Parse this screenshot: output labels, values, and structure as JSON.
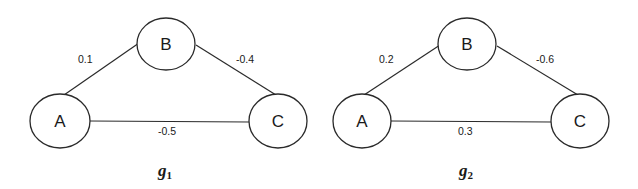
{
  "graphs": [
    {
      "caption": "g",
      "caption_sub": "1",
      "nodes": {
        "A": {
          "label": "A",
          "cx": 60,
          "cy": 121,
          "rx": 30,
          "ry": 27
        },
        "B": {
          "label": "B",
          "cx": 166,
          "cy": 44,
          "rx": 29,
          "ry": 26
        },
        "C": {
          "label": "C",
          "cx": 278,
          "cy": 121,
          "rx": 29,
          "ry": 27
        }
      },
      "edges": {
        "AB": {
          "from": "A",
          "to": "B",
          "weight": "0.1"
        },
        "BC": {
          "from": "B",
          "to": "C",
          "weight": "-0.4"
        },
        "AC": {
          "from": "A",
          "to": "C",
          "weight": "-0.5"
        }
      }
    },
    {
      "caption": "g",
      "caption_sub": "2",
      "nodes": {
        "A": {
          "label": "A",
          "cx": 362,
          "cy": 121,
          "rx": 29,
          "ry": 27
        },
        "B": {
          "label": "B",
          "cx": 467,
          "cy": 44,
          "rx": 29,
          "ry": 26
        },
        "C": {
          "label": "C",
          "cx": 580,
          "cy": 121,
          "rx": 29,
          "ry": 27
        }
      },
      "edges": {
        "AB": {
          "from": "A",
          "to": "B",
          "weight": "0.2"
        },
        "BC": {
          "from": "B",
          "to": "C",
          "weight": "-0.6"
        },
        "AC": {
          "from": "A",
          "to": "C",
          "weight": "0.3"
        }
      }
    }
  ]
}
